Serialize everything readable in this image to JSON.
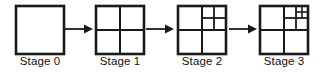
{
  "figure": {
    "geometry": {
      "square_size": 48,
      "stroke_color": "#1a1a1a",
      "outer_stroke_width": 2.6,
      "inner_stroke_width": 2.0,
      "fill_color": "#ffffff"
    },
    "stages": [
      {
        "id": "stage-0",
        "label": "Stage 0",
        "index": 0,
        "divisions": 0,
        "description": "A single undivided square",
        "subdivision_levels": [],
        "square_count": 1
      },
      {
        "id": "stage-1",
        "label": "Stage 1",
        "index": 1,
        "divisions": 1,
        "description": "Square divided into a 2 by 2 grid of four equal quadrants",
        "subdivision_levels": [
          {
            "level": 1,
            "region": "whole-square",
            "x": 0,
            "y": 0,
            "size": 48
          }
        ],
        "square_count": 4
      },
      {
        "id": "stage-2",
        "label": "Stage 2",
        "index": 2,
        "divisions": 2,
        "description": "Top-right quadrant further divided into a 2 by 2 grid",
        "subdivision_levels": [
          {
            "level": 1,
            "region": "whole-square",
            "x": 0,
            "y": 0,
            "size": 48
          },
          {
            "level": 2,
            "region": "top-right-quadrant",
            "x": 24,
            "y": 0,
            "size": 24
          }
        ],
        "square_count": 7
      },
      {
        "id": "stage-3",
        "label": "Stage 3",
        "index": 3,
        "divisions": 3,
        "description": "Top-right sub-square of the top-right quadrant further divided into a 2 by 2 grid",
        "subdivision_levels": [
          {
            "level": 1,
            "region": "whole-square",
            "x": 0,
            "y": 0,
            "size": 48
          },
          {
            "level": 2,
            "region": "top-right-quadrant",
            "x": 24,
            "y": 0,
            "size": 24
          },
          {
            "level": 3,
            "region": "top-right-of-top-right",
            "x": 36,
            "y": 0,
            "size": 12
          }
        ],
        "square_count": 10
      }
    ],
    "arrows": [
      {
        "id": "arrow-0-1",
        "from": "stage-0",
        "to": "stage-1",
        "direction": "right"
      },
      {
        "id": "arrow-1-2",
        "from": "stage-1",
        "to": "stage-2",
        "direction": "right"
      },
      {
        "id": "arrow-2-3",
        "from": "stage-2",
        "to": "stage-3",
        "direction": "right"
      }
    ]
  }
}
